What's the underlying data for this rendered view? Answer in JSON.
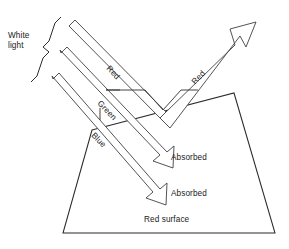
{
  "figure": {
    "title_implicit": "Reflection of white light from a red surface",
    "background_color": "#ffffff",
    "line_color": "#2b2b2b",
    "text_color": "#1a1a1a",
    "width": 289,
    "height": 249
  },
  "labels": {
    "white_light_line1": "White",
    "white_light_line2": "light",
    "incident_red": "Red",
    "incident_green": "Green",
    "incident_blue": "Blue",
    "reflected_red": "Red",
    "absorbed_green": "Absorbed",
    "absorbed_blue": "Absorbed",
    "surface": "Red surface"
  },
  "rays": [
    {
      "name": "red-ray",
      "label": "Red",
      "fate": "reflected",
      "reflected_label": "Red"
    },
    {
      "name": "green-ray",
      "label": "Green",
      "fate": "absorbed",
      "absorbed_label": "Absorbed"
    },
    {
      "name": "blue-ray",
      "label": "Blue",
      "fate": "absorbed",
      "absorbed_label": "Absorbed"
    }
  ],
  "surface": {
    "name": "red-surface",
    "label": "Red surface",
    "shape": "trapezoid"
  }
}
